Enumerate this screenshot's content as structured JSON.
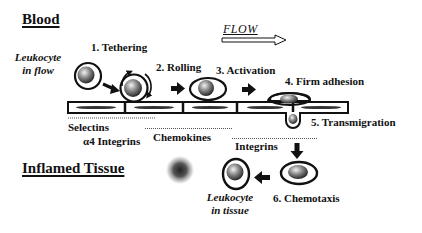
{
  "titles": {
    "blood": "Blood",
    "inflamed_tissue": "Inflamed Tissue",
    "flow": "FLOW"
  },
  "cell_labels": {
    "in_flow_line1": "Leukocyte",
    "in_flow_line2": "in flow",
    "in_tissue_line1": "Leukocyte",
    "in_tissue_line2": "in tissue"
  },
  "steps": [
    {
      "label": "1. Tethering"
    },
    {
      "label": "2. Rolling"
    },
    {
      "label": "3. Activation"
    },
    {
      "label": "4. Firm adhesion"
    },
    {
      "label": "5. Transmigration"
    },
    {
      "label": "6. Chemotaxis"
    }
  ],
  "molecules": {
    "selectins": "Selectins",
    "a4_integrins": "α4 Integrins",
    "chemokines": "Chemokines",
    "integrins": "Integrins"
  },
  "colors": {
    "ink": "#111111",
    "background": "#ffffff"
  }
}
